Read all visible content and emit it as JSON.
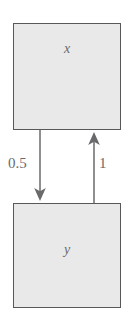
{
  "diagram": {
    "type": "directed-graph",
    "background_color": "#ffffff",
    "node_fill_color": "#e9e9e9",
    "node_border_color": "#58585a",
    "edge_color": "#6a6a6c",
    "label_color": "#6a6a6c",
    "nodes": [
      {
        "id": "x",
        "label": "x",
        "position": "top"
      },
      {
        "id": "y",
        "label": "y",
        "position": "bottom"
      }
    ],
    "edges": [
      {
        "id": "x-to-y",
        "from": "x",
        "to": "y",
        "weight": "0.5",
        "direction": "down",
        "side": "left"
      },
      {
        "id": "y-to-x",
        "from": "y",
        "to": "x",
        "weight": "1",
        "direction": "up",
        "side": "right"
      }
    ]
  }
}
